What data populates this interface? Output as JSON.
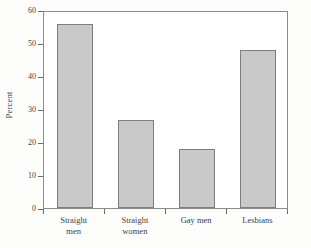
{
  "chart_data": {
    "type": "bar",
    "title": "",
    "subtitle": "",
    "xlabel": "",
    "ylabel": "Percent",
    "categories": [
      "Straight men",
      "Straight women",
      "Gay men",
      "Lesbians"
    ],
    "category_lines": [
      [
        "Straight",
        "men"
      ],
      [
        "Straight",
        "women"
      ],
      [
        "Gay men",
        ""
      ],
      [
        "Lesbians",
        ""
      ]
    ],
    "values": [
      56.3,
      27.0,
      18.0,
      48.5
    ],
    "ylim": [
      0,
      60
    ],
    "ytick_values": [
      0,
      10,
      20,
      30,
      40,
      50,
      60
    ],
    "ytick_labels": [
      "0",
      "10",
      "20",
      "30",
      "40",
      "50",
      "60"
    ],
    "grid": false,
    "legend": null,
    "legend_position": "none",
    "annotations": []
  },
  "style": {
    "bar_fill": "#c9c9c9",
    "bar_border": "#7d7d7d",
    "frame_color": "#8c8c8c",
    "text_color": "#3f3f3f",
    "background": "#ffffff"
  }
}
